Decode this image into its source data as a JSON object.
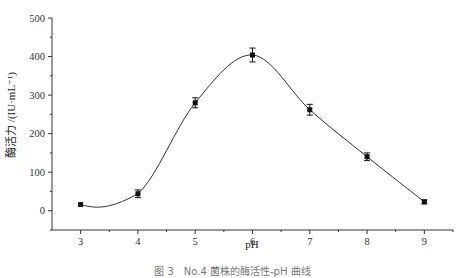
{
  "chart_data": {
    "type": "line",
    "title": "",
    "xlabel": "pH",
    "ylabel": "酶活力 /(IU·mL⁻¹)",
    "x": [
      3,
      4,
      5,
      6,
      7,
      8,
      9
    ],
    "series": [
      {
        "name": "酶活力",
        "values": [
          16,
          44,
          280,
          404,
          262,
          140,
          23
        ],
        "error": [
          3,
          10,
          13,
          18,
          14,
          10,
          5
        ],
        "marker": "square",
        "line": "smooth spline"
      }
    ],
    "x_ticks": [
      "3",
      "4",
      "5",
      "6",
      "7",
      "8",
      "9"
    ],
    "y_ticks": [
      "0",
      "100",
      "200",
      "300",
      "400",
      "500"
    ],
    "xlim": [
      2.5,
      9.5
    ],
    "ylim": [
      -50,
      500
    ],
    "grid": false,
    "legend": "none"
  },
  "figure": {
    "caption": "图 3　No.4 菌株的酶活性-pH 曲线"
  },
  "colors": {
    "line": "#333333",
    "marker": "#111111",
    "axis": "#333333"
  }
}
